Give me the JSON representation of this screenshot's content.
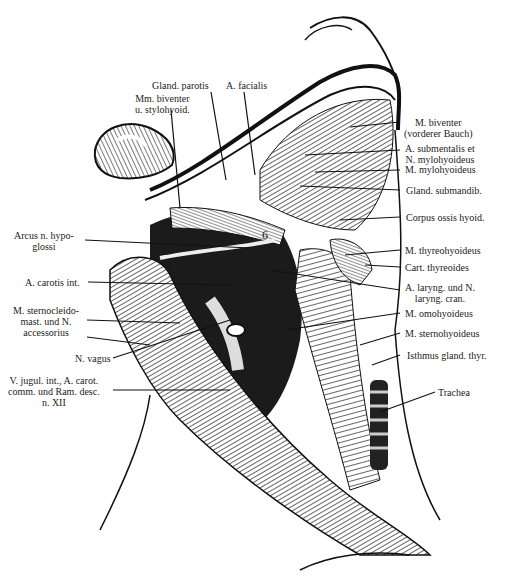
{
  "figure": {
    "background": "#ffffff",
    "ink": "#1a1a1a",
    "inline_numbers": [
      "1",
      "2",
      "3",
      "6"
    ]
  },
  "labels": {
    "top": [
      {
        "id": "gland-parotis",
        "lines": [
          "Gland. parotis"
        ]
      },
      {
        "id": "a-facialis",
        "lines": [
          "A. facialis"
        ]
      },
      {
        "id": "mm-biventer-stylohyoid",
        "lines": [
          "Mm. biventer",
          "u. stylohyoid."
        ]
      }
    ],
    "right": [
      {
        "id": "m-biventer-vorderer",
        "lines": [
          "M. biventer",
          "(vorderer Bauch)"
        ]
      },
      {
        "id": "a-submentalis",
        "lines": [
          "A. submentalis et",
          "N. mylohyoideus"
        ]
      },
      {
        "id": "m-mylohyoideus",
        "lines": [
          "M. mylohyoideus"
        ]
      },
      {
        "id": "gland-submandib",
        "lines": [
          "Gland. submandib."
        ]
      },
      {
        "id": "corpus-ossis-hyoid",
        "lines": [
          "Corpus ossis hyoid."
        ]
      },
      {
        "id": "m-thyreohyoideus",
        "lines": [
          "M. thyreohyoideus"
        ]
      },
      {
        "id": "cart-thyreoides",
        "lines": [
          "Cart. thyreoides"
        ]
      },
      {
        "id": "a-laryng",
        "lines": [
          "A. laryng. und N.",
          "laryng. cran."
        ]
      },
      {
        "id": "m-omohyoideus",
        "lines": [
          "M. omohyoideus"
        ]
      },
      {
        "id": "m-sternohyoideus",
        "lines": [
          "M. sternohyoideus"
        ]
      },
      {
        "id": "isthmus-gland-thyr",
        "lines": [
          "Isthmus gland. thyr."
        ]
      },
      {
        "id": "trachea",
        "lines": [
          "Trachea"
        ]
      }
    ],
    "left": [
      {
        "id": "arcus-n-hypoglossi",
        "lines": [
          "Arcus n. hypo-",
          "glossi"
        ]
      },
      {
        "id": "a-carotis-int",
        "lines": [
          "A. carotis int."
        ]
      },
      {
        "id": "m-sternocleido",
        "lines": [
          "M. sternocleido-",
          "mast. und N.",
          "accessorius"
        ]
      },
      {
        "id": "n-vagus",
        "lines": [
          "N. vagus"
        ]
      },
      {
        "id": "v-jugul",
        "lines": [
          "V. jugul. int., A. carot.",
          "comm. und Ram. desc.",
          "n. XII"
        ]
      }
    ]
  }
}
